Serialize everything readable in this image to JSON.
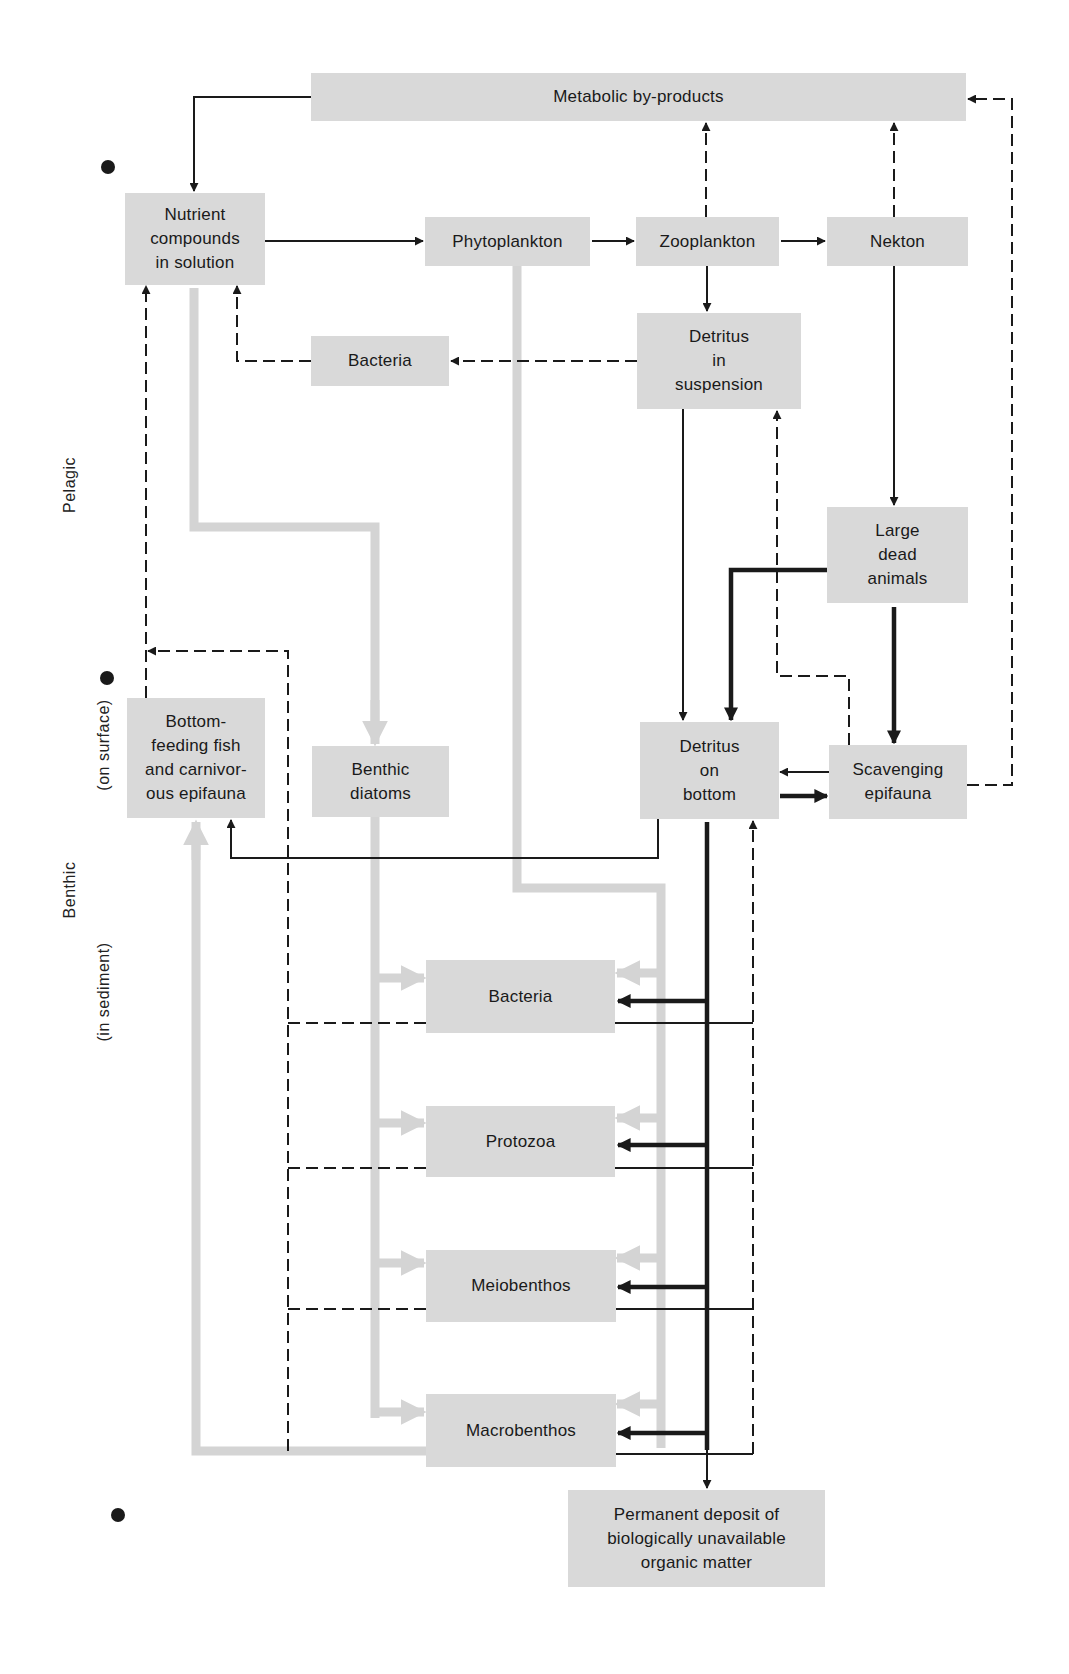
{
  "diagram": {
    "type": "flow-diagram",
    "topic": "Marine food web and organic matter cycling (pelagic and benthic)",
    "zones": [
      {
        "id": "pelagic",
        "label": "Pelagic"
      },
      {
        "id": "benthic",
        "label": "Benthic"
      },
      {
        "id": "on_surface",
        "label": "(on surface)"
      },
      {
        "id": "in_sediment",
        "label": "(in sediment)"
      }
    ],
    "nodes": {
      "metabolic": "Metabolic by-products",
      "nutrients": "Nutrient\ncompounds\nin solution",
      "phytoplankton": "Phytoplankton",
      "zooplankton": "Zooplankton",
      "nekton": "Nekton",
      "bacteria_pelagic": "Bacteria",
      "detritus_suspension": "Detritus\nin\nsuspension",
      "large_dead": "Large\ndead\nanimals",
      "bottom_feeding": "Bottom-\nfeeding fish\nand carnivor-\nous epifauna",
      "benthic_diatoms": "Benthic\ndiatoms",
      "detritus_bottom": "Detritus\non\nbottom",
      "scavenging": "Scavenging\nepifauna",
      "bacteria_sediment": "Bacteria",
      "protozoa": "Protozoa",
      "meiobenthos": "Meiobenthos",
      "macrobenthos": "Macrobenthos",
      "permanent_deposit": "Permanent deposit of\nbiologically unavailable\norganic matter"
    },
    "edge_styles": {
      "solid": "material transfer (thin black)",
      "heavy": "major detrital transfer (thick black)",
      "dashed": "regeneration / excretion (dashed black)",
      "gray": "primary production pathway (light gray)"
    },
    "edges": [
      {
        "from": "metabolic",
        "to": "nutrients",
        "style": "solid"
      },
      {
        "from": "nutrients",
        "to": "phytoplankton",
        "style": "solid"
      },
      {
        "from": "phytoplankton",
        "to": "zooplankton",
        "style": "solid"
      },
      {
        "from": "zooplankton",
        "to": "nekton",
        "style": "solid"
      },
      {
        "from": "zooplankton",
        "to": "metabolic",
        "style": "dashed"
      },
      {
        "from": "nekton",
        "to": "metabolic",
        "style": "dashed"
      },
      {
        "from": "zooplankton",
        "to": "detritus_suspension",
        "style": "solid"
      },
      {
        "from": "detritus_suspension",
        "to": "bacteria_pelagic",
        "style": "dashed"
      },
      {
        "from": "bacteria_pelagic",
        "to": "nutrients",
        "style": "dashed"
      },
      {
        "from": "nekton",
        "to": "large_dead",
        "style": "solid"
      },
      {
        "from": "detritus_suspension",
        "to": "detritus_bottom",
        "style": "solid"
      },
      {
        "from": "large_dead",
        "to": "detritus_bottom",
        "style": "heavy"
      },
      {
        "from": "large_dead",
        "to": "scavenging",
        "style": "heavy"
      },
      {
        "from": "scavenging",
        "to": "detritus_suspension",
        "style": "dashed"
      },
      {
        "from": "scavenging",
        "to": "metabolic",
        "style": "dashed"
      },
      {
        "from": "scavenging",
        "to": "detritus_bottom",
        "style": "solid"
      },
      {
        "from": "detritus_bottom",
        "to": "scavenging",
        "style": "heavy"
      },
      {
        "from": "detritus_bottom",
        "to": "bottom_feeding",
        "style": "solid"
      },
      {
        "from": "bottom_feeding",
        "to": "nutrients",
        "style": "dashed"
      },
      {
        "from": "nutrients",
        "to": "benthic_diatoms",
        "style": "gray"
      },
      {
        "from": "phytoplankton",
        "to": "bacteria_sediment",
        "style": "gray"
      },
      {
        "from": "phytoplankton",
        "to": "protozoa",
        "style": "gray"
      },
      {
        "from": "phytoplankton",
        "to": "meiobenthos",
        "style": "gray"
      },
      {
        "from": "phytoplankton",
        "to": "macrobenthos",
        "style": "gray"
      },
      {
        "from": "benthic_diatoms",
        "to": "bacteria_sediment",
        "style": "gray"
      },
      {
        "from": "benthic_diatoms",
        "to": "protozoa",
        "style": "gray"
      },
      {
        "from": "benthic_diatoms",
        "to": "meiobenthos",
        "style": "gray"
      },
      {
        "from": "benthic_diatoms",
        "to": "macrobenthos",
        "style": "gray"
      },
      {
        "from": "macrobenthos",
        "to": "bottom_feeding",
        "style": "gray"
      },
      {
        "from": "detritus_bottom",
        "to": "bacteria_sediment",
        "style": "heavy"
      },
      {
        "from": "detritus_bottom",
        "to": "protozoa",
        "style": "heavy"
      },
      {
        "from": "detritus_bottom",
        "to": "meiobenthos",
        "style": "heavy"
      },
      {
        "from": "detritus_bottom",
        "to": "macrobenthos",
        "style": "heavy"
      },
      {
        "from": "detritus_bottom",
        "to": "permanent_deposit",
        "style": "solid"
      },
      {
        "from": "bacteria_sediment",
        "to": "detritus_bottom",
        "style": "solid+dashed"
      },
      {
        "from": "protozoa",
        "to": "detritus_bottom",
        "style": "solid+dashed"
      },
      {
        "from": "meiobenthos",
        "to": "detritus_bottom",
        "style": "solid+dashed"
      },
      {
        "from": "macrobenthos",
        "to": "detritus_bottom",
        "style": "solid+dashed"
      },
      {
        "from": "bacteria_sediment",
        "to": "bottom_feeding",
        "style": "dashed"
      },
      {
        "from": "protozoa",
        "to": "bottom_feeding",
        "style": "dashed"
      },
      {
        "from": "meiobenthos",
        "to": "bottom_feeding",
        "style": "dashed"
      },
      {
        "from": "macrobenthos",
        "to": "bottom_feeding",
        "style": "dashed"
      }
    ],
    "colors": {
      "box_fill": "#d9d9d9",
      "gray_path": "#d4d4d4",
      "line": "#1a1a1a",
      "background": "#ffffff"
    }
  }
}
